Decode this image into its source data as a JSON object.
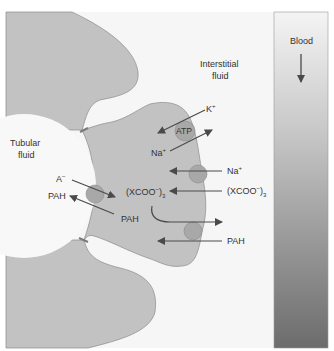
{
  "labels": {
    "tubular_fluid_line1": "Tubular",
    "tubular_fluid_line2": "fluid",
    "interstitial_line1": "Interstitial",
    "interstitial_line2": "fluid",
    "blood": "Blood",
    "atp": "ATP",
    "k_plus": "K",
    "k_sup": "+",
    "na_plus_pump": "Na",
    "na_plus_pump_sup": "+",
    "a_minus": "A",
    "a_minus_sup": "−",
    "pah_lumen": "PAH",
    "pah_cell": "PAH",
    "xcoo_cell": "(XCOO",
    "xcoo_cell_sup": "−",
    "xcoo_cell_paren": ")",
    "xcoo_cell_sub": "3",
    "na_plus_basolateral": "Na",
    "na_plus_basolateral_sup": "+",
    "xcoo_interstitial": "(XCOO",
    "xcoo_interstitial_sup": "−",
    "xcoo_interstitial_paren": ")",
    "xcoo_interstitial_sub": "3",
    "pah_interstitial": "PAH"
  },
  "colors": {
    "cell": "#c2c2c2",
    "cell_outline": "#8a8a8a",
    "lumen": "#f8f8f8",
    "background": "#f6f6f6",
    "transporter": "#a8a8a8",
    "arrow": "#4a4a4a",
    "blood_top": "#f2f2f2",
    "blood_bottom": "#6e6e6e"
  }
}
